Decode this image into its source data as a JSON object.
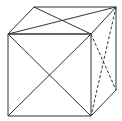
{
  "diagram": {
    "title": "",
    "type": "cube with face diagonals",
    "stroke_color": "#333333",
    "background": "#ffffff",
    "vertices": {
      "A": [
        8,
        34
      ],
      "B": [
        91,
        34
      ],
      "C": [
        91,
        116
      ],
      "D": [
        8,
        116
      ],
      "E": [
        34,
        7
      ],
      "F": [
        116,
        7
      ],
      "G": [
        116,
        90
      ]
    },
    "edges_solid": [
      [
        "A",
        "B"
      ],
      [
        "B",
        "C"
      ],
      [
        "C",
        "D"
      ],
      [
        "D",
        "A"
      ],
      [
        "A",
        "E"
      ],
      [
        "E",
        "F"
      ],
      [
        "F",
        "B"
      ],
      [
        "F",
        "G"
      ],
      [
        "G",
        "C"
      ]
    ],
    "diagonals_solid": [
      [
        "A",
        "C"
      ],
      [
        "B",
        "D"
      ],
      [
        "E",
        "B"
      ],
      [
        "A",
        "F"
      ]
    ],
    "diagonals_dashed": [
      [
        "B",
        "G"
      ],
      [
        "F",
        "C"
      ]
    ]
  }
}
